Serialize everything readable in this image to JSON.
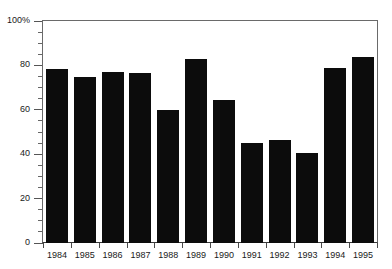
{
  "chart_data": {
    "type": "bar",
    "title": "",
    "subtitle": "",
    "xlabel": "",
    "ylabel": "",
    "categories": [
      "1984",
      "1985",
      "1986",
      "1987",
      "1988",
      "1989",
      "1990",
      "1991",
      "1992",
      "1993",
      "1994",
      "1995"
    ],
    "values": [
      78.5,
      75,
      77,
      76.5,
      60,
      83,
      64.5,
      45,
      46.5,
      40.5,
      79,
      84
    ],
    "ylim": [
      0,
      100
    ],
    "xlim_note": "categorical",
    "y_major_ticks": [
      0,
      20,
      40,
      60,
      80,
      100
    ],
    "y_minor_tick_step": 5,
    "y_tick_labels": [
      "0",
      "20",
      "40",
      "60",
      "80",
      "100%"
    ],
    "grid": false,
    "legend": null,
    "legend_position": "none",
    "annotations": [],
    "series": [
      {
        "name": "",
        "values": [
          78.5,
          75,
          77,
          76.5,
          60,
          83,
          64.5,
          45,
          46.5,
          40.5,
          79,
          84
        ]
      }
    ]
  },
  "style": {
    "bar_color": "#0c0c0c",
    "background_color": "#ffffff",
    "axis_color": "#6a6a6a",
    "text_color": "#1a1a1a"
  }
}
